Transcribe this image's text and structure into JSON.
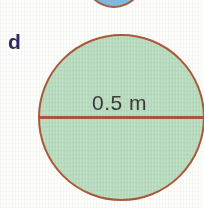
{
  "figure": {
    "part_label": "d",
    "background_color": "#fdfdfc",
    "shapes": [
      {
        "name": "partial-blue-circle",
        "type": "circle",
        "fill_color": "#7fbbdf",
        "stroke_color": "#a85a3c",
        "clipped": "top"
      },
      {
        "name": "green-circle",
        "type": "circle",
        "fill_color": "#bfe1c5",
        "stroke_color": "#ab5a3a",
        "clipped": "right",
        "dimension_label": "0.5 m",
        "dimension_type": "diameter"
      }
    ]
  },
  "labels": {
    "part": "d",
    "dimension": "0.5 m"
  },
  "colors": {
    "green_fill": "#bfe1c5",
    "blue_fill": "#7fbbdf",
    "outline": "#ab5a3a",
    "diameter_line": "#a85737",
    "part_label_text": "#322a64",
    "dimension_text": "#3b3b3b"
  }
}
